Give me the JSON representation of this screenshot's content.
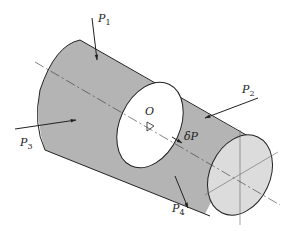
{
  "diagram": {
    "title": "",
    "colors": {
      "body_fill": "#b4b4b4",
      "end_face_fill": "#dcdcdc",
      "section_fill": "#ffffff",
      "stroke": "#222222"
    },
    "labels": {
      "origin": "O",
      "delta_force": "δP",
      "forces": [
        {
          "name": "P",
          "sub": "1"
        },
        {
          "name": "P",
          "sub": "2"
        },
        {
          "name": "P",
          "sub": "3"
        },
        {
          "name": "P",
          "sub": "4"
        }
      ]
    }
  }
}
